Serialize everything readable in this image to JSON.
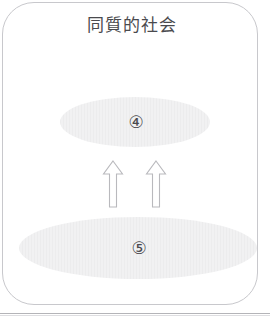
{
  "figure": {
    "title": "同質的社会",
    "frame": {
      "shape": "rounded-rectangle",
      "border_color": "#c8c8cc",
      "background_color": "#ffffff"
    },
    "groups": [
      {
        "id": "upper",
        "label": "④",
        "shape": "ellipse",
        "fill_color": "#ececed",
        "size": "small"
      },
      {
        "id": "lower",
        "label": "⑤",
        "shape": "ellipse",
        "fill_color": "#ececed",
        "size": "large"
      }
    ],
    "arrows": [
      {
        "id": "left",
        "direction": "up",
        "style": "hollow-block",
        "stroke_color": "#b9b9bd"
      },
      {
        "id": "right",
        "direction": "up",
        "style": "hollow-block",
        "stroke_color": "#b9b9bd"
      }
    ],
    "text_color": "#4a4a4e"
  }
}
